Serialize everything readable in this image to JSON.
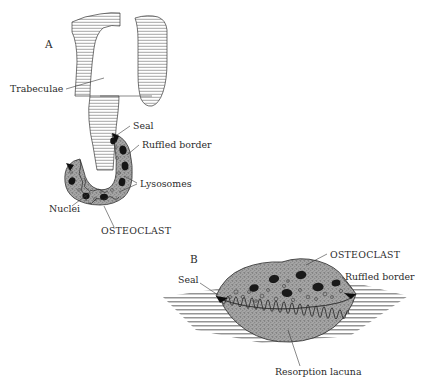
{
  "figure": {
    "background_color": "#ffffff",
    "ink_color": "#2b2b2b",
    "panels": [
      {
        "letter": "A",
        "description": "Sectional view of an osteoclast at the tip of a bone trabecula",
        "letter_x": 45,
        "letter_y": 48
      },
      {
        "letter": "B",
        "description": "Three-dimensional view of an osteoclast sitting in a resorption lacuna",
        "letter_x": 190,
        "letter_y": 262
      }
    ]
  },
  "panel_a": {
    "letter": "A",
    "labels": {
      "trabeculae": "Trabeculae",
      "seal": "Seal",
      "ruffled_border": "Ruffled border",
      "lysosomes": "Lysosomes",
      "nuclei": "Nuclei",
      "osteoclast": "OSTEOCLAST"
    },
    "label_positions": {
      "trabeculae": {
        "x": 10,
        "y": 92
      },
      "seal": {
        "x": 133,
        "y": 129
      },
      "ruffled_border": {
        "x": 142,
        "y": 148
      },
      "lysosomes": {
        "x": 140,
        "y": 186
      },
      "nuclei": {
        "x": 49,
        "y": 212
      },
      "osteoclast": {
        "x": 101,
        "y": 233
      }
    },
    "cell_fill": "#9d9d9d",
    "nucleus_fill": "#141414",
    "bone_hatch_color": "#6d6d6d"
  },
  "panel_b": {
    "letter": "B",
    "labels": {
      "osteoclast": "OSTEOCLAST",
      "ruffled_border": "Ruffled border",
      "seal": "Seal",
      "resorption_lacuna": "Resorption lacuna"
    },
    "label_positions": {
      "osteoclast": {
        "x": 330,
        "y": 257
      },
      "ruffled_border": {
        "x": 345,
        "y": 279
      },
      "seal": {
        "x": 179,
        "y": 282
      },
      "resorption_lacuna": {
        "x": 275,
        "y": 373
      }
    },
    "cell_fill": "#9d9d9d",
    "nucleus_fill": "#141414",
    "bone_hatch_color": "#6d6d6d"
  }
}
